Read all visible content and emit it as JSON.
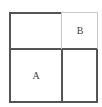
{
  "diagram": {
    "type": "grid-partition",
    "frame": {
      "x": 9,
      "y": 12,
      "width": 88,
      "height": 90
    },
    "dividers": {
      "vertical_x": 62,
      "horizontal_y": 49
    },
    "cells": [
      {
        "id": "top-left",
        "label": ""
      },
      {
        "id": "top-right",
        "label": "B",
        "highlight_border": true
      },
      {
        "id": "bottom-left",
        "label": "A"
      },
      {
        "id": "bottom-right",
        "label": ""
      }
    ],
    "colors": {
      "dark_line": "#555555",
      "light_line": "#c8c8c8",
      "text": "#444444",
      "background": "#ffffff"
    }
  }
}
